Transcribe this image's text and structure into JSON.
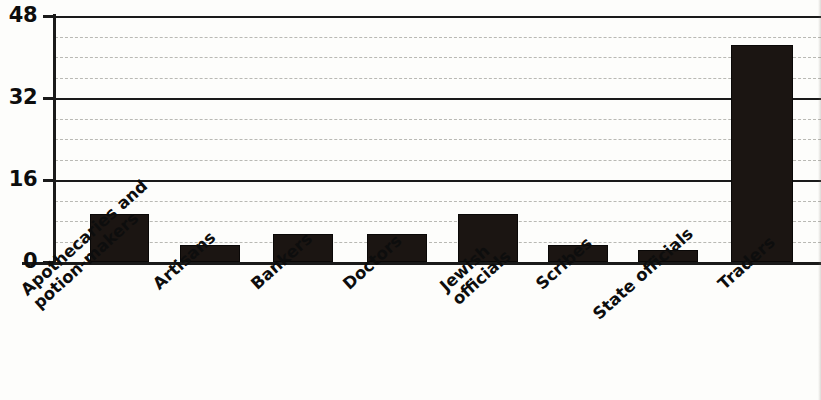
{
  "chart_data": {
    "type": "bar",
    "title": "",
    "xlabel": "",
    "ylabel": "",
    "ylim": [
      0,
      48
    ],
    "yticks": [
      0,
      16,
      32,
      48
    ],
    "ytick_labels": [
      "0",
      "16",
      "32",
      "48"
    ],
    "minor_gridline_step": 4,
    "grid": true,
    "legend": "none",
    "orientation": "vertical",
    "bar_color": "#1b1512",
    "categories": [
      "Apothecaries and potion-makers",
      "Artisans",
      "Bankers",
      "Doctors",
      "Jewish officials",
      "Scribes",
      "State officials",
      "Traders"
    ],
    "category_lines": [
      [
        "Apothecaries and",
        "potion-makers"
      ],
      [
        "Artisans",
        ""
      ],
      [
        "Bankers",
        ""
      ],
      [
        "Doctors",
        ""
      ],
      [
        "Jewish",
        "officials"
      ],
      [
        "Scribes",
        ""
      ],
      [
        "State officials",
        ""
      ],
      [
        "Traders",
        ""
      ]
    ],
    "values": [
      9,
      3,
      5,
      5,
      9,
      3,
      2,
      42
    ]
  },
  "axis": {
    "y_ticks": [
      {
        "label": "48",
        "value": 48
      },
      {
        "label": "32",
        "value": 32
      },
      {
        "label": "16",
        "value": 16
      },
      {
        "label": "0",
        "value": 0
      }
    ]
  }
}
